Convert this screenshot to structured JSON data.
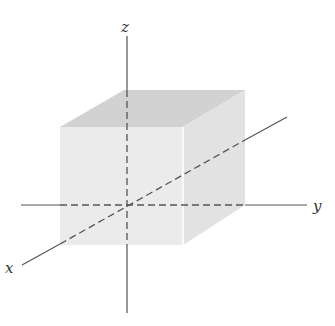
{
  "diagram": {
    "title": "",
    "shape": "cube",
    "axes": {
      "x": {
        "label": "x"
      },
      "y": {
        "label": "y"
      },
      "z": {
        "label": "z"
      }
    },
    "colors": {
      "top_face": "#d2d2d2",
      "front_face": "#ebebeb",
      "right_face": "#e2e2e2",
      "axis": "#555555",
      "hidden_axis": "#555555"
    }
  }
}
